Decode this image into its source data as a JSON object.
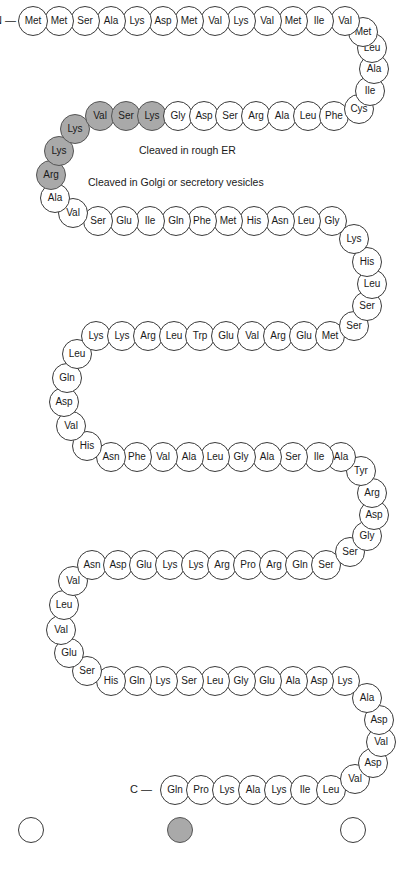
{
  "diagram": {
    "n_terminus_label": "N —",
    "c_terminus_label": "C —",
    "colors": {
      "white_circle": "#ffffff",
      "gray_circle": "#a9a9a9",
      "outline": "#3a3a3a",
      "text": "#1a1a1a",
      "background": "#ffffff"
    },
    "annotations": [
      {
        "text": "Cleaved in rough ER",
        "x": 139,
        "y": 144
      },
      {
        "text": "Cleaved in Golgi or secretory vesicles",
        "x": 88,
        "y": 176
      }
    ],
    "legend": [
      {
        "shade": "white",
        "label": "",
        "x": 18,
        "y": 817
      },
      {
        "shade": "gray",
        "label": "",
        "x": 167,
        "y": 817
      },
      {
        "shade": "white",
        "label": "",
        "x": 340,
        "y": 817
      }
    ],
    "residues": [
      {
        "aa": "Met",
        "shade": "white",
        "x": 18,
        "y": 6
      },
      {
        "aa": "Met",
        "shade": "white",
        "x": 44,
        "y": 6
      },
      {
        "aa": "Ser",
        "shade": "white",
        "x": 70,
        "y": 6
      },
      {
        "aa": "Ala",
        "shade": "white",
        "x": 96,
        "y": 6
      },
      {
        "aa": "Lys",
        "shade": "white",
        "x": 122,
        "y": 6
      },
      {
        "aa": "Asp",
        "shade": "white",
        "x": 148,
        "y": 6
      },
      {
        "aa": "Met",
        "shade": "white",
        "x": 174,
        "y": 6
      },
      {
        "aa": "Val",
        "shade": "white",
        "x": 200,
        "y": 6
      },
      {
        "aa": "Lys",
        "shade": "white",
        "x": 226,
        "y": 6
      },
      {
        "aa": "Val",
        "shade": "white",
        "x": 252,
        "y": 6
      },
      {
        "aa": "Met",
        "shade": "white",
        "x": 278,
        "y": 6
      },
      {
        "aa": "Ile",
        "shade": "white",
        "x": 304,
        "y": 6
      },
      {
        "aa": "Val",
        "shade": "white",
        "x": 330,
        "y": 6
      },
      {
        "aa": "Met",
        "shade": "white",
        "x": 348,
        "y": 17
      },
      {
        "aa": "Leu",
        "shade": "white",
        "x": 357,
        "y": 33
      },
      {
        "aa": "Ala",
        "shade": "white",
        "x": 359,
        "y": 54
      },
      {
        "aa": "Ile",
        "shade": "white",
        "x": 355,
        "y": 76
      },
      {
        "aa": "Cys",
        "shade": "white",
        "x": 344,
        "y": 94
      },
      {
        "aa": "Phe",
        "shade": "white",
        "x": 319,
        "y": 101
      },
      {
        "aa": "Leu",
        "shade": "white",
        "x": 293,
        "y": 101
      },
      {
        "aa": "Ala",
        "shade": "white",
        "x": 267,
        "y": 101
      },
      {
        "aa": "Arg",
        "shade": "white",
        "x": 241,
        "y": 101
      },
      {
        "aa": "Ser",
        "shade": "white",
        "x": 215,
        "y": 101
      },
      {
        "aa": "Asp",
        "shade": "white",
        "x": 189,
        "y": 101
      },
      {
        "aa": "Gly",
        "shade": "white",
        "x": 163,
        "y": 101
      },
      {
        "aa": "Lys",
        "shade": "gray",
        "x": 137,
        "y": 101
      },
      {
        "aa": "Ser",
        "shade": "gray",
        "x": 111,
        "y": 101
      },
      {
        "aa": "Val",
        "shade": "gray",
        "x": 85,
        "y": 101
      },
      {
        "aa": "Lys",
        "shade": "gray",
        "x": 60,
        "y": 114
      },
      {
        "aa": "Lys",
        "shade": "gray",
        "x": 44,
        "y": 136
      },
      {
        "aa": "Arg",
        "shade": "gray",
        "x": 36,
        "y": 160
      },
      {
        "aa": "Ala",
        "shade": "white",
        "x": 40,
        "y": 183
      },
      {
        "aa": "Val",
        "shade": "white",
        "x": 58,
        "y": 198
      },
      {
        "aa": "Ser",
        "shade": "white",
        "x": 83,
        "y": 206
      },
      {
        "aa": "Glu",
        "shade": "white",
        "x": 109,
        "y": 206
      },
      {
        "aa": "Ile",
        "shade": "white",
        "x": 135,
        "y": 206
      },
      {
        "aa": "Gln",
        "shade": "white",
        "x": 161,
        "y": 206
      },
      {
        "aa": "Phe",
        "shade": "white",
        "x": 187,
        "y": 206
      },
      {
        "aa": "Met",
        "shade": "white",
        "x": 213,
        "y": 206
      },
      {
        "aa": "His",
        "shade": "white",
        "x": 239,
        "y": 206
      },
      {
        "aa": "Asn",
        "shade": "white",
        "x": 265,
        "y": 206
      },
      {
        "aa": "Leu",
        "shade": "white",
        "x": 291,
        "y": 206
      },
      {
        "aa": "Gly",
        "shade": "white",
        "x": 317,
        "y": 206
      },
      {
        "aa": "Lys",
        "shade": "white",
        "x": 339,
        "y": 224
      },
      {
        "aa": "His",
        "shade": "white",
        "x": 352,
        "y": 247
      },
      {
        "aa": "Leu",
        "shade": "white",
        "x": 357,
        "y": 269
      },
      {
        "aa": "Ser",
        "shade": "white",
        "x": 352,
        "y": 291
      },
      {
        "aa": "Ser",
        "shade": "white",
        "x": 339,
        "y": 311
      },
      {
        "aa": "Met",
        "shade": "white",
        "x": 315,
        "y": 321
      },
      {
        "aa": "Glu",
        "shade": "white",
        "x": 289,
        "y": 321
      },
      {
        "aa": "Arg",
        "shade": "white",
        "x": 263,
        "y": 321
      },
      {
        "aa": "Val",
        "shade": "white",
        "x": 237,
        "y": 321
      },
      {
        "aa": "Glu",
        "shade": "white",
        "x": 211,
        "y": 321
      },
      {
        "aa": "Trp",
        "shade": "white",
        "x": 185,
        "y": 321
      },
      {
        "aa": "Leu",
        "shade": "white",
        "x": 159,
        "y": 321
      },
      {
        "aa": "Arg",
        "shade": "white",
        "x": 133,
        "y": 321
      },
      {
        "aa": "Lys",
        "shade": "white",
        "x": 107,
        "y": 321
      },
      {
        "aa": "Lys",
        "shade": "white",
        "x": 81,
        "y": 321
      },
      {
        "aa": "Leu",
        "shade": "white",
        "x": 62,
        "y": 339
      },
      {
        "aa": "Gln",
        "shade": "white",
        "x": 52,
        "y": 363
      },
      {
        "aa": "Asp",
        "shade": "white",
        "x": 49,
        "y": 387
      },
      {
        "aa": "Val",
        "shade": "white",
        "x": 56,
        "y": 411
      },
      {
        "aa": "His",
        "shade": "white",
        "x": 72,
        "y": 431
      },
      {
        "aa": "Asn",
        "shade": "white",
        "x": 96,
        "y": 442
      },
      {
        "aa": "Phe",
        "shade": "white",
        "x": 122,
        "y": 442
      },
      {
        "aa": "Val",
        "shade": "white",
        "x": 148,
        "y": 442
      },
      {
        "aa": "Ala",
        "shade": "white",
        "x": 174,
        "y": 442
      },
      {
        "aa": "Leu",
        "shade": "white",
        "x": 200,
        "y": 442
      },
      {
        "aa": "Gly",
        "shade": "white",
        "x": 226,
        "y": 442
      },
      {
        "aa": "Ala",
        "shade": "white",
        "x": 252,
        "y": 442
      },
      {
        "aa": "Ser",
        "shade": "white",
        "x": 278,
        "y": 442
      },
      {
        "aa": "Ile",
        "shade": "white",
        "x": 304,
        "y": 442
      },
      {
        "aa": "Ala",
        "shade": "white",
        "x": 326,
        "y": 442
      },
      {
        "aa": "Tyr",
        "shade": "white",
        "x": 346,
        "y": 456
      },
      {
        "aa": "Arg",
        "shade": "white",
        "x": 357,
        "y": 478
      },
      {
        "aa": "Asp",
        "shade": "white",
        "x": 359,
        "y": 500
      },
      {
        "aa": "Gly",
        "shade": "white",
        "x": 352,
        "y": 521
      },
      {
        "aa": "Ser",
        "shade": "white",
        "x": 335,
        "y": 537
      },
      {
        "aa": "Ser",
        "shade": "white",
        "x": 311,
        "y": 550
      },
      {
        "aa": "Gln",
        "shade": "white",
        "x": 285,
        "y": 550
      },
      {
        "aa": "Arg",
        "shade": "white",
        "x": 259,
        "y": 550
      },
      {
        "aa": "Pro",
        "shade": "white",
        "x": 233,
        "y": 550
      },
      {
        "aa": "Arg",
        "shade": "white",
        "x": 207,
        "y": 550
      },
      {
        "aa": "Lys",
        "shade": "white",
        "x": 181,
        "y": 550
      },
      {
        "aa": "Lys",
        "shade": "white",
        "x": 155,
        "y": 550
      },
      {
        "aa": "Glu",
        "shade": "white",
        "x": 129,
        "y": 550
      },
      {
        "aa": "Asp",
        "shade": "white",
        "x": 103,
        "y": 550
      },
      {
        "aa": "Asn",
        "shade": "white",
        "x": 77,
        "y": 550
      },
      {
        "aa": "Val",
        "shade": "white",
        "x": 58,
        "y": 566
      },
      {
        "aa": "Leu",
        "shade": "white",
        "x": 49,
        "y": 590
      },
      {
        "aa": "Val",
        "shade": "white",
        "x": 46,
        "y": 615
      },
      {
        "aa": "Glu",
        "shade": "white",
        "x": 54,
        "y": 638
      },
      {
        "aa": "Ser",
        "shade": "white",
        "x": 72,
        "y": 656
      },
      {
        "aa": "His",
        "shade": "white",
        "x": 96,
        "y": 666
      },
      {
        "aa": "Gln",
        "shade": "white",
        "x": 122,
        "y": 666
      },
      {
        "aa": "Lys",
        "shade": "white",
        "x": 148,
        "y": 666
      },
      {
        "aa": "Ser",
        "shade": "white",
        "x": 174,
        "y": 666
      },
      {
        "aa": "Leu",
        "shade": "white",
        "x": 200,
        "y": 666
      },
      {
        "aa": "Gly",
        "shade": "white",
        "x": 226,
        "y": 666
      },
      {
        "aa": "Glu",
        "shade": "white",
        "x": 252,
        "y": 666
      },
      {
        "aa": "Ala",
        "shade": "white",
        "x": 278,
        "y": 666
      },
      {
        "aa": "Asp",
        "shade": "white",
        "x": 304,
        "y": 666
      },
      {
        "aa": "Lys",
        "shade": "white",
        "x": 330,
        "y": 666
      },
      {
        "aa": "Ala",
        "shade": "white",
        "x": 352,
        "y": 683
      },
      {
        "aa": "Asp",
        "shade": "white",
        "x": 364,
        "y": 705
      },
      {
        "aa": "Val",
        "shade": "white",
        "x": 366,
        "y": 727
      },
      {
        "aa": "Asp",
        "shade": "white",
        "x": 358,
        "y": 748
      },
      {
        "aa": "Val",
        "shade": "white",
        "x": 340,
        "y": 764
      },
      {
        "aa": "Leu",
        "shade": "white",
        "x": 316,
        "y": 775
      },
      {
        "aa": "Ile",
        "shade": "white",
        "x": 290,
        "y": 775
      },
      {
        "aa": "Lys",
        "shade": "white",
        "x": 264,
        "y": 775
      },
      {
        "aa": "Ala",
        "shade": "white",
        "x": 238,
        "y": 775
      },
      {
        "aa": "Lys",
        "shade": "white",
        "x": 212,
        "y": 775
      },
      {
        "aa": "Pro",
        "shade": "white",
        "x": 186,
        "y": 775
      },
      {
        "aa": "Gln",
        "shade": "white",
        "x": 160,
        "y": 775
      }
    ],
    "sequence_string": "MMSAKDMVKVMIVMLAICFLARSDGKSVKKRAVSEIQFMHNLGKHLSSMERVEWLRKKLQDVHNFVALGASIAYRDGSSQRPRKKEDNVLVESHQKSLGEADKADVDVLIKAKPQ"
  }
}
